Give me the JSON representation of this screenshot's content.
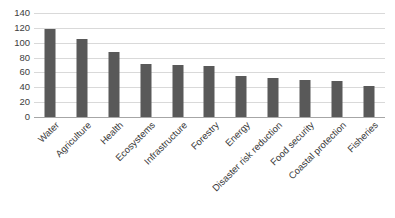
{
  "chart_data": {
    "type": "bar",
    "title": "",
    "subtitle": "",
    "xlabel": "",
    "ylabel": "",
    "ylim": [
      0,
      140
    ],
    "ytick_step": 20,
    "yticks": [
      0,
      20,
      40,
      60,
      80,
      100,
      120,
      140
    ],
    "grid": true,
    "legend": false,
    "legend_position": "none",
    "xtick_rotation": -45,
    "bar_color": "#595959",
    "gridline_color": "#d9d9d9",
    "axis_color": "#a6a6a6",
    "categories": [
      "Water",
      "Agriculture",
      "Health",
      "Ecosystems",
      "Infrastructure",
      "Forestry",
      "Energy",
      "Disaster risk reduction",
      "Food security",
      "Coastal protection",
      "Fisheries"
    ],
    "values": [
      118,
      105,
      88,
      72,
      70,
      69,
      55,
      53,
      50,
      48,
      42
    ]
  }
}
